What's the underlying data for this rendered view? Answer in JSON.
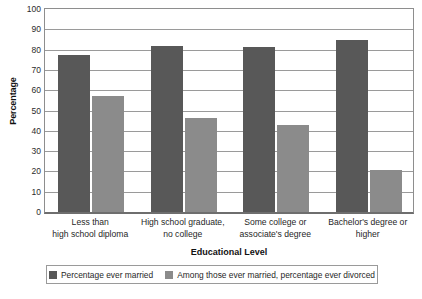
{
  "chart_data": {
    "type": "bar",
    "title": "",
    "xlabel": "Educational Level",
    "ylabel": "Percentage",
    "ylim": [
      0,
      100
    ],
    "ytick_step": 10,
    "yticks": [
      100,
      90,
      80,
      70,
      60,
      50,
      40,
      30,
      20,
      10,
      0
    ],
    "grid": true,
    "legend_position": "bottom",
    "categories": [
      "Less than\nhigh school diploma",
      "High school graduate,\nno college",
      "Some college or\nassociate's degree",
      "Bachelor's degree or\nhigher"
    ],
    "category_lines": [
      [
        "Less than",
        "high school diploma"
      ],
      [
        "High school graduate,",
        "no college"
      ],
      [
        "Some college or",
        "associate's degree"
      ],
      [
        "Bachelor's degree or",
        "higher"
      ]
    ],
    "series": [
      {
        "name": "Percentage ever married",
        "color": "#585858",
        "values": [
          77.5,
          82.0,
          81.5,
          84.5
        ]
      },
      {
        "name": "Among those ever married, percentage ever divorced",
        "color": "#8b8b8b",
        "values": [
          57.0,
          46.5,
          43.0,
          20.5
        ]
      }
    ]
  },
  "axes": {
    "y_title": "Percentage",
    "x_title": "Educational Level"
  },
  "legend": {
    "entries": [
      {
        "label": "Percentage ever married",
        "color": "#585858"
      },
      {
        "label": "Among those ever married, percentage ever divorced",
        "color": "#8b8b8b"
      }
    ]
  },
  "colors": {
    "series_dark": "#585858",
    "series_light": "#8b8b8b",
    "gridline": "#9a9a9a",
    "axis": "#6e6e6e",
    "background": "#ffffff"
  }
}
